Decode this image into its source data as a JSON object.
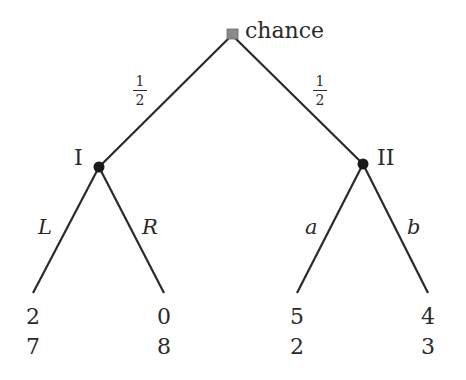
{
  "diagram": {
    "type": "extensive-form game tree",
    "root": {
      "label": "chance",
      "shape": "square",
      "color": "#8a8a8a",
      "x": 232,
      "y": 35
    },
    "chance_branches": [
      {
        "prob_num": "1",
        "prob_den": "2",
        "to": "I"
      },
      {
        "prob_num": "1",
        "prob_den": "2",
        "to": "II"
      }
    ],
    "players": [
      {
        "label": "I",
        "x": 99,
        "y": 167,
        "actions": [
          {
            "label": "L",
            "payoff_top": "2",
            "payoff_bottom": "7",
            "end_x": 33,
            "end_y": 293
          },
          {
            "label": "R",
            "payoff_top": "0",
            "payoff_bottom": "8",
            "end_x": 164,
            "end_y": 293
          }
        ]
      },
      {
        "label": "II",
        "x": 363,
        "y": 164,
        "actions": [
          {
            "label": "a",
            "payoff_top": "5",
            "payoff_bottom": "2",
            "end_x": 297,
            "end_y": 293
          },
          {
            "label": "b",
            "payoff_top": "4",
            "payoff_bottom": "3",
            "end_x": 428,
            "end_y": 293
          }
        ]
      }
    ],
    "colors": {
      "line": "#2a2a2a",
      "node": "#1a1a1a",
      "chance_node": "#8a8a8a",
      "background": "#ffffff"
    }
  }
}
